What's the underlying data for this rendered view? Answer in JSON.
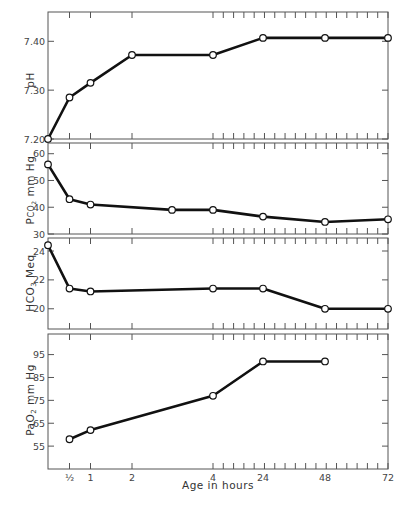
{
  "chart_data": {
    "type": "line",
    "title": "",
    "xlabel": "Age in hours",
    "x_categories": [
      "0",
      "½",
      "1",
      "2",
      "3",
      "4",
      "24",
      "48",
      "72"
    ],
    "x_tick_labels": [
      "½",
      "1",
      "2",
      "4",
      "24",
      "48",
      "72"
    ],
    "grid": false,
    "legend": null,
    "panels": [
      {
        "ylabel": "pH",
        "yticks": [
          "7.20",
          "7.30",
          "7.40"
        ],
        "ylim": [
          7.2,
          7.46
        ],
        "points": [
          {
            "x": "0",
            "y": 7.2
          },
          {
            "x": "½",
            "y": 7.285
          },
          {
            "x": "1",
            "y": 7.315
          },
          {
            "x": "2",
            "y": 7.372
          },
          {
            "x": "4",
            "y": 7.372
          },
          {
            "x": "24",
            "y": 7.407
          },
          {
            "x": "48",
            "y": 7.407
          },
          {
            "x": "72",
            "y": 7.407
          }
        ]
      },
      {
        "ylabel": "PCO2 mm Hg",
        "yticks": [
          "30",
          "40",
          "50",
          "60"
        ],
        "ylim": [
          30,
          64
        ],
        "points": [
          {
            "x": "0",
            "y": 56
          },
          {
            "x": "½",
            "y": 43
          },
          {
            "x": "1",
            "y": 41
          },
          {
            "x": "3",
            "y": 39
          },
          {
            "x": "4",
            "y": 39
          },
          {
            "x": "24",
            "y": 36.5
          },
          {
            "x": "48",
            "y": 34.5
          },
          {
            "x": "72",
            "y": 35.5
          }
        ]
      },
      {
        "ylabel": "HCO3 Meq",
        "yticks": [
          "20",
          "22",
          "24"
        ],
        "ylim": [
          18.6,
          24.9
        ],
        "points": [
          {
            "x": "0",
            "y": 24.4
          },
          {
            "x": "½",
            "y": 21.4
          },
          {
            "x": "1",
            "y": 21.2
          },
          {
            "x": "4",
            "y": 21.4
          },
          {
            "x": "24",
            "y": 21.4
          },
          {
            "x": "48",
            "y": 20.0
          },
          {
            "x": "72",
            "y": 20.0
          }
        ]
      },
      {
        "ylabel": "PaO2 mm Hg",
        "yticks": [
          "55",
          "65",
          "75",
          "85",
          "95"
        ],
        "ylim": [
          45,
          104
        ],
        "points": [
          {
            "x": "½",
            "y": 58
          },
          {
            "x": "1",
            "y": 62
          },
          {
            "x": "4",
            "y": 77
          },
          {
            "x": "24",
            "y": 92
          },
          {
            "x": "48",
            "y": 92
          }
        ]
      }
    ]
  },
  "labels": {
    "panel1_ylabel": "pH",
    "panel2_ylabel_main": "P",
    "panel2_ylabel_sub": "CO",
    "panel2_ylabel_sub2": "2",
    "panel2_ylabel_rest": " mm Hg",
    "panel3_ylabel": "HCO",
    "panel3_ylabel_sub": "3",
    "panel3_ylabel_rest": " Meq",
    "panel4_ylabel": "PaO",
    "panel4_ylabel_sub": "2",
    "panel4_ylabel_rest": " mm Hg",
    "xlabel": "Age in hours"
  }
}
